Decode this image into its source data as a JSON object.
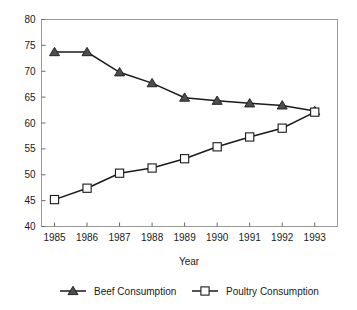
{
  "chart_data": {
    "type": "line",
    "title": "",
    "xlabel": "Year",
    "ylabel": "",
    "categories": [
      "1985",
      "1986",
      "1987",
      "1988",
      "1989",
      "1990",
      "1991",
      "1992",
      "1993"
    ],
    "x": [
      1985,
      1986,
      1987,
      1988,
      1989,
      1990,
      1991,
      1992,
      1993
    ],
    "series": [
      {
        "name": "Beef Consumption",
        "marker": "filled-triangle",
        "color": "#4d4d4d",
        "values": [
          73.7,
          73.7,
          69.8,
          67.7,
          64.9,
          64.3,
          63.8,
          63.4,
          62.3
        ]
      },
      {
        "name": "Poultry Consumption",
        "marker": "open-square",
        "color": "#ffffff",
        "values": [
          45.2,
          47.4,
          50.3,
          51.3,
          53.1,
          55.4,
          57.3,
          59.0,
          62.1
        ]
      }
    ],
    "ylim": [
      40,
      80
    ],
    "yticks": [
      40,
      45,
      50,
      55,
      60,
      65,
      70,
      75,
      80
    ],
    "ytick_labels": [
      "40",
      "45",
      "50",
      "55",
      "60",
      "65",
      "70",
      "75",
      "80"
    ],
    "xlim": [
      1984.6,
      1993.7
    ],
    "grid": false,
    "legend_position": "bottom",
    "line_color": "#1a1a1a",
    "frame_color": "#9a9a9a"
  },
  "legend": {
    "entries": [
      {
        "label": "Beef Consumption"
      },
      {
        "label": "Poultry Consumption"
      }
    ]
  },
  "axes": {
    "x_title": "Year"
  }
}
